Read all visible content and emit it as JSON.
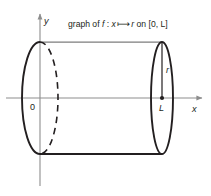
{
  "figure": {
    "title_caption": "graph of f : x ⟼ r on [0, L]",
    "caption_parts": {
      "prefix": "graph of ",
      "function_name": "f",
      "colon": " : ",
      "domain_var": "x",
      "mapsto_arrow": "⟼",
      "image_var": "r",
      "on_word": " on ",
      "interval": "[0, L]"
    },
    "axes": {
      "x_label": "x",
      "y_label": "y",
      "origin_label": "0"
    },
    "annotations": {
      "radius_label": "r",
      "length_label": "L"
    },
    "colors": {
      "outline": "#231f20",
      "axis": "#8d8d8d",
      "top_edge": "#7d7d7d",
      "background": "#ffffff"
    },
    "geometry": {
      "left_ellipse_cx": 40,
      "left_ellipse_cy": 98,
      "left_ellipse_rx": 18,
      "left_ellipse_ry": 56,
      "right_ellipse_cx": 162,
      "right_ellipse_cy": 98,
      "right_ellipse_rx": 11,
      "right_ellipse_ry": 56
    }
  }
}
